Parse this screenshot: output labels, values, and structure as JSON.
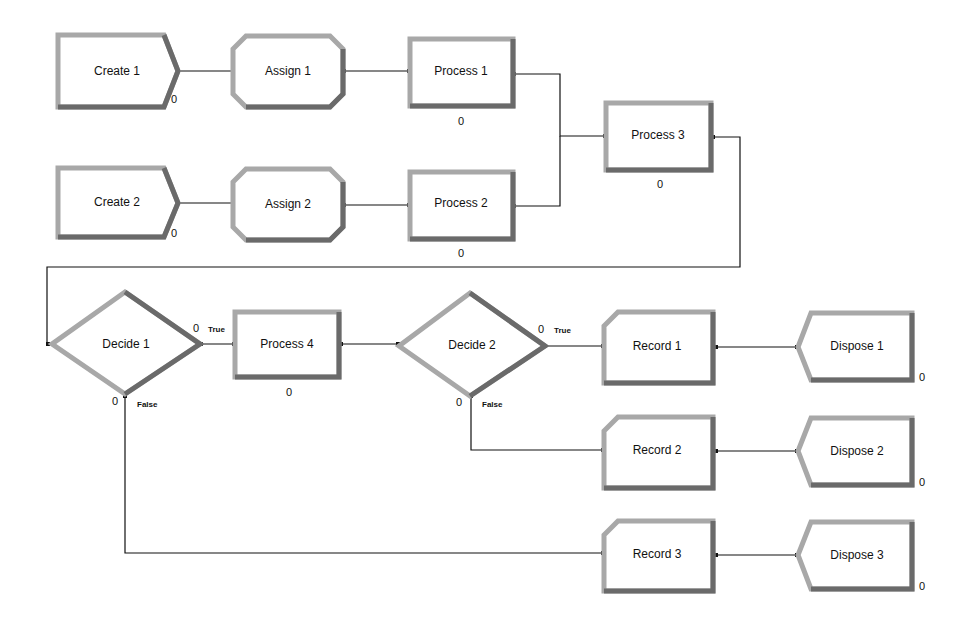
{
  "modules": {
    "create1": {
      "label": "Create 1",
      "count": "0"
    },
    "create2": {
      "label": "Create 2",
      "count": "0"
    },
    "assign1": {
      "label": "Assign 1"
    },
    "assign2": {
      "label": "Assign 2"
    },
    "process1": {
      "label": "Process 1",
      "count": "0"
    },
    "process2": {
      "label": "Process 2",
      "count": "0"
    },
    "process3": {
      "label": "Process 3",
      "count": "0"
    },
    "process4": {
      "label": "Process 4",
      "count": "0"
    },
    "decide1": {
      "label": "Decide 1",
      "true_count": "0",
      "false_count": "0",
      "true_label": "True",
      "false_label": "False"
    },
    "decide2": {
      "label": "Decide 2",
      "true_count": "0",
      "false_count": "0",
      "true_label": "True",
      "false_label": "False"
    },
    "record1": {
      "label": "Record 1"
    },
    "record2": {
      "label": "Record 2"
    },
    "record3": {
      "label": "Record 3"
    },
    "dispose1": {
      "label": "Dispose 1",
      "count": "0"
    },
    "dispose2": {
      "label": "Dispose 2",
      "count": "0"
    },
    "dispose3": {
      "label": "Dispose 3",
      "count": "0"
    }
  },
  "colors": {
    "border_light": "#a8a8a8",
    "border_dark": "#6a6a6a",
    "fill": "#ffffff",
    "connector": "#111111"
  }
}
